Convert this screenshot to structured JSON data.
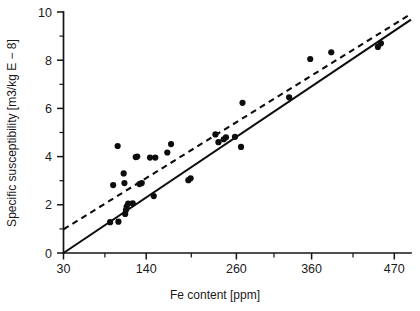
{
  "figure": {
    "background_color": "#ffffff",
    "ink_color": "#0d0d0d"
  },
  "axes": {
    "x_title": "Fe content [ppm]",
    "y_title": "Specific susceptibility [m3/kg E − 8]",
    "x_tick_labels": [
      "30",
      "140",
      "260",
      "360",
      "470"
    ],
    "y_tick_labels": [
      "0",
      "2",
      "4",
      "6",
      "8",
      "10"
    ]
  },
  "chart_data": {
    "type": "scatter",
    "title": "",
    "xlabel": "Fe content [ppm]",
    "ylabel": "Specific susceptibility [m3/kg E − 8]",
    "xlim": [
      30,
      492
    ],
    "ylim": [
      0,
      10
    ],
    "xticks": [
      30,
      140,
      260,
      360,
      470
    ],
    "yticks": [
      0,
      2,
      4,
      6,
      8,
      10
    ],
    "x_minor_ticks": [
      85,
      200,
      310,
      415
    ],
    "y_minor_ticks": [
      1,
      3,
      5,
      7,
      9
    ],
    "grid": false,
    "legend": null,
    "series": [
      {
        "name": "samples",
        "type": "scatter",
        "marker": "filled-circle",
        "color": "#0d0d0d",
        "points": [
          [
            92,
            1.28
          ],
          [
            103,
            1.3
          ],
          [
            96,
            2.82
          ],
          [
            102,
            4.44
          ],
          [
            112,
            1.62
          ],
          [
            113,
            1.78
          ],
          [
            114,
            1.93
          ],
          [
            116,
            2.05
          ],
          [
            111,
            2.9
          ],
          [
            110,
            3.3
          ],
          [
            126,
            3.98
          ],
          [
            128,
            4.0
          ],
          [
            122,
            2.06
          ],
          [
            131,
            2.86
          ],
          [
            134,
            2.9
          ],
          [
            145,
            3.96
          ],
          [
            152,
            3.96
          ],
          [
            150,
            2.36
          ],
          [
            173,
            4.52
          ],
          [
            168,
            4.17
          ],
          [
            196,
            3.02
          ],
          [
            199,
            3.1
          ],
          [
            232,
            4.92
          ],
          [
            236,
            4.6
          ],
          [
            243,
            4.72
          ],
          [
            246,
            4.8
          ],
          [
            258,
            4.82
          ],
          [
            268,
            6.23
          ],
          [
            266,
            4.4
          ],
          [
            330,
            6.46
          ],
          [
            358,
            8.05
          ],
          [
            386,
            8.33
          ],
          [
            448,
            8.55
          ],
          [
            452,
            8.7
          ]
        ]
      },
      {
        "name": "linear-fit-solid",
        "type": "line",
        "style": "solid",
        "color": "#0d0d0d",
        "endpoints": [
          [
            30,
            0.0
          ],
          [
            492,
            9.68
          ]
        ]
      },
      {
        "name": "regression-dashed",
        "type": "line",
        "style": "dashed",
        "color": "#0d0d0d",
        "endpoints": [
          [
            30,
            0.98
          ],
          [
            492,
            9.92
          ]
        ]
      }
    ]
  }
}
